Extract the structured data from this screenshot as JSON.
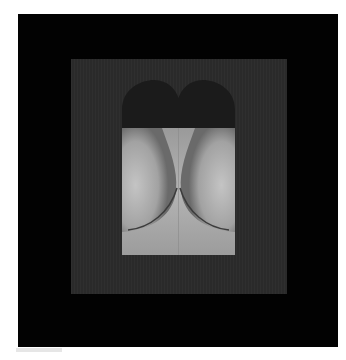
{
  "artwork": {
    "description": "Framed monochrome artwork: dark heart shape over a light gray torso-like photographic form",
    "colors": {
      "page_background": "#ffffff",
      "outer_frame": "#020202",
      "inner_panel": "#2a2a2a",
      "heart": "#1a1a1a",
      "light_region": "#a8a8a8"
    }
  }
}
